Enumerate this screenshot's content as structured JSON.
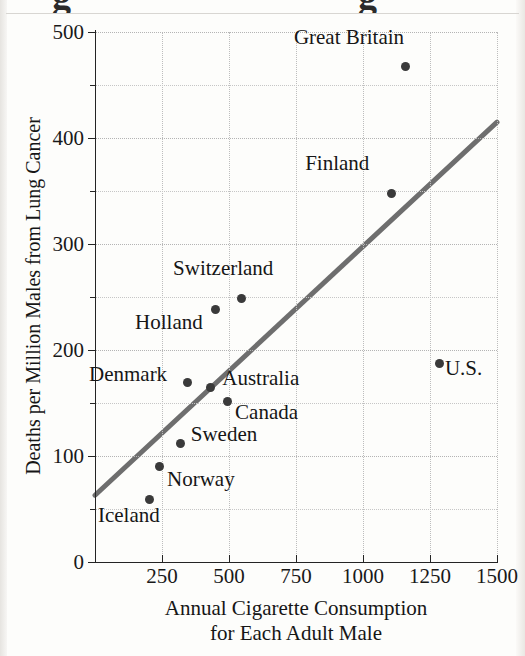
{
  "figure": {
    "partial_title_note": "g",
    "ylabel": "Deaths per Million Males from Lung Cancer",
    "xlabel_line1": "Annual Cigarette Consumption",
    "xlabel_line2": "for Each Adult Male",
    "trend_color": "#6e6e6e",
    "point_color": "#3a3a3a",
    "axis_color": "#242424"
  },
  "chart_data": {
    "type": "scatter",
    "title": "",
    "xlabel": "Annual Cigarette Consumption for Each Adult Male",
    "ylabel": "Deaths per Million Males from Lung Cancer",
    "xlim": [
      0,
      1500
    ],
    "ylim": [
      0,
      500
    ],
    "xticks": [
      0,
      250,
      500,
      750,
      1000,
      1250,
      1500
    ],
    "xticklabels": [
      "",
      "250",
      "500",
      "750",
      "1000",
      "1250",
      "1500"
    ],
    "yticks": [
      0,
      100,
      200,
      300,
      400,
      500
    ],
    "yticklabels": [
      "0",
      "100",
      "200",
      "300",
      "400",
      "500"
    ],
    "yminorticks": [
      50,
      150,
      250,
      350,
      450
    ],
    "grid": true,
    "grid_style": "dotted",
    "legend": "none",
    "points": [
      {
        "label": "Great Britain",
        "x": 1160,
        "y": 467,
        "label_dx": -112,
        "label_dy": -30
      },
      {
        "label": "Finland",
        "x": 1105,
        "y": 348,
        "label_dx": -86,
        "label_dy": -30
      },
      {
        "label": "U.S.",
        "x": 1287,
        "y": 187,
        "label_dx": 5,
        "label_dy": 4
      },
      {
        "label": "Switzerland",
        "x": 545,
        "y": 249,
        "label_dx": -68,
        "label_dy": -30
      },
      {
        "label": "Holland",
        "x": 448,
        "y": 238,
        "label_dx": -80,
        "label_dy": 12
      },
      {
        "label": "Denmark",
        "x": 347,
        "y": 169,
        "label_dx": -99,
        "label_dy": -9
      },
      {
        "label": "Australia",
        "x": 430,
        "y": 165,
        "label_dx": 12,
        "label_dy": -9
      },
      {
        "label": "Canada",
        "x": 493,
        "y": 151,
        "label_dx": 8,
        "label_dy": 10
      },
      {
        "label": "Sweden",
        "x": 320,
        "y": 112,
        "label_dx": 10,
        "label_dy": -9
      },
      {
        "label": "Norway",
        "x": 239,
        "y": 90,
        "label_dx": 8,
        "label_dy": 12
      },
      {
        "label": "Iceland",
        "x": 205,
        "y": 59,
        "label_dx": -52,
        "label_dy": 16
      }
    ],
    "trendline": {
      "name": "regression-line",
      "x0": 0,
      "y0": 63,
      "x1": 1500,
      "y1": 415
    }
  }
}
